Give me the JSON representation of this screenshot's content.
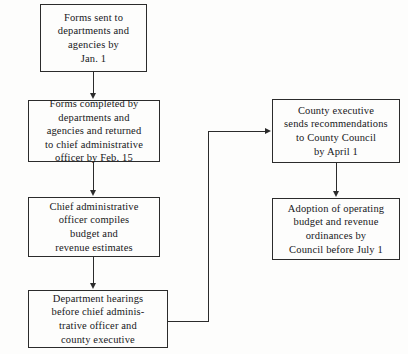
{
  "diagram": {
    "background_color": "#fdfdfc",
    "line_color": "#2b2b2b",
    "text_color": "#17171a",
    "nodes": [
      {
        "id": "forms-sent",
        "text": "Forms sent to\ndepartments and\nagencies by\nJan. 1"
      },
      {
        "id": "forms-completed",
        "text": "Forms completed by\ndepartments and\nagencies and returned\nto chief administrative\nofficer by Feb. 15"
      },
      {
        "id": "officer-compiles",
        "text": "Chief administrative\nofficer compiles\nbudget and\nrevenue estimates"
      },
      {
        "id": "department-hearings",
        "text": "Department hearings\nbefore chief adminis-\ntrative officer and\ncounty executive"
      },
      {
        "id": "executive-recommendations",
        "text": "County executive\nsends recommendations\nto County Council\nby April 1"
      },
      {
        "id": "adoption-of-budget",
        "text": "Adoption of operating\nbudget and revenue\nordinances by\nCouncil before July 1"
      }
    ],
    "connectors": [
      {
        "id": "forms-sent-to-forms-completed",
        "kind": "arrow-down"
      },
      {
        "id": "forms-completed-to-officer-compiles",
        "kind": "arrow-down"
      },
      {
        "id": "officer-compiles-to-department-hearings",
        "kind": "arrow-down"
      },
      {
        "id": "department-hearings-to-executive-recommendations",
        "kind": "elbow-arrow-right"
      },
      {
        "id": "executive-recommendations-to-adoption",
        "kind": "arrow-down"
      }
    ]
  }
}
